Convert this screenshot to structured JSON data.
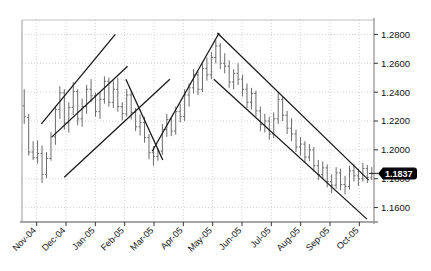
{
  "chart_data": {
    "type": "ohlc",
    "title": "",
    "subtitle": "",
    "xlabel": "",
    "ylabel": "",
    "grid": true,
    "legend": null,
    "y_axis_position": "right",
    "ylim": [
      1.15,
      1.29
    ],
    "yticks": [
      "1.2800",
      "1.2600",
      "1.2400",
      "1.2200",
      "1.2000",
      "1.1800",
      "1.1600"
    ],
    "ytick_values": [
      1.28,
      1.26,
      1.24,
      1.22,
      1.2,
      1.18,
      1.16
    ],
    "xticks": [
      "Nov-04",
      "Dec-04",
      "Jan-05",
      "Feb-05",
      "Mar-05",
      "Apr-05",
      "May-05",
      "Jun-05",
      "Jul-05",
      "Aug-05",
      "Sep-05",
      "Oct-05"
    ],
    "current_price_label": "1.1837",
    "current_price_value": 1.1837,
    "bar_color": "#6b6b6b",
    "trendline_color": "#1a1a1a",
    "grid_color": "#c8c8c8",
    "axis_color": "#8a8a8a",
    "marker_bg": "#000000",
    "marker_fg": "#ffffff",
    "series": [
      {
        "name": "Price",
        "bars": [
          {
            "o": 1.2305,
            "h": 1.242,
            "l": 1.218,
            "c": 1.223
          },
          {
            "o": 1.2225,
            "h": 1.225,
            "l": 1.196,
            "c": 1.1985
          },
          {
            "o": 1.1985,
            "h": 1.206,
            "l": 1.193,
            "c": 1.1945
          },
          {
            "o": 1.1945,
            "h": 1.2065,
            "l": 1.1905,
            "c": 1.1975
          },
          {
            "o": 1.1975,
            "h": 1.203,
            "l": 1.177,
            "c": 1.183
          },
          {
            "o": 1.183,
            "h": 1.1985,
            "l": 1.1805,
            "c": 1.194
          },
          {
            "o": 1.194,
            "h": 1.2125,
            "l": 1.1925,
            "c": 1.209
          },
          {
            "o": 1.209,
            "h": 1.2305,
            "l": 1.2035,
            "c": 1.228
          },
          {
            "o": 1.228,
            "h": 1.244,
            "l": 1.2215,
            "c": 1.2395
          },
          {
            "o": 1.2395,
            "h": 1.242,
            "l": 1.214,
            "c": 1.2185
          },
          {
            "o": 1.2185,
            "h": 1.233,
            "l": 1.212,
            "c": 1.2295
          },
          {
            "o": 1.2295,
            "h": 1.247,
            "l": 1.224,
            "c": 1.2405
          },
          {
            "o": 1.2405,
            "h": 1.242,
            "l": 1.217,
            "c": 1.2215
          },
          {
            "o": 1.2215,
            "h": 1.2355,
            "l": 1.216,
            "c": 1.23
          },
          {
            "o": 1.23,
            "h": 1.245,
            "l": 1.225,
            "c": 1.242
          },
          {
            "o": 1.242,
            "h": 1.249,
            "l": 1.233,
            "c": 1.2375
          },
          {
            "o": 1.2375,
            "h": 1.2395,
            "l": 1.223,
            "c": 1.2265
          },
          {
            "o": 1.2265,
            "h": 1.24,
            "l": 1.2215,
            "c": 1.235
          },
          {
            "o": 1.235,
            "h": 1.251,
            "l": 1.232,
            "c": 1.2475
          },
          {
            "o": 1.2475,
            "h": 1.25,
            "l": 1.23,
            "c": 1.233
          },
          {
            "o": 1.233,
            "h": 1.248,
            "l": 1.229,
            "c": 1.242
          },
          {
            "o": 1.242,
            "h": 1.25,
            "l": 1.2265,
            "c": 1.23
          },
          {
            "o": 1.23,
            "h": 1.233,
            "l": 1.2205,
            "c": 1.225
          },
          {
            "o": 1.225,
            "h": 1.242,
            "l": 1.223,
            "c": 1.238
          },
          {
            "o": 1.238,
            "h": 1.24,
            "l": 1.221,
            "c": 1.226
          },
          {
            "o": 1.226,
            "h": 1.229,
            "l": 1.213,
            "c": 1.216
          },
          {
            "o": 1.216,
            "h": 1.2245,
            "l": 1.21,
            "c": 1.219
          },
          {
            "o": 1.219,
            "h": 1.223,
            "l": 1.205,
            "c": 1.2085
          },
          {
            "o": 1.2085,
            "h": 1.211,
            "l": 1.1935,
            "c": 1.198
          },
          {
            "o": 1.198,
            "h": 1.2025,
            "l": 1.189,
            "c": 1.1955
          },
          {
            "o": 1.1955,
            "h": 1.201,
            "l": 1.1925,
            "c": 1.199
          },
          {
            "o": 1.199,
            "h": 1.218,
            "l": 1.1965,
            "c": 1.214
          },
          {
            "o": 1.214,
            "h": 1.225,
            "l": 1.209,
            "c": 1.221
          },
          {
            "o": 1.221,
            "h": 1.223,
            "l": 1.2095,
            "c": 1.213
          },
          {
            "o": 1.213,
            "h": 1.23,
            "l": 1.2105,
            "c": 1.2265
          },
          {
            "o": 1.2265,
            "h": 1.232,
            "l": 1.219,
            "c": 1.223
          },
          {
            "o": 1.223,
            "h": 1.242,
            "l": 1.22,
            "c": 1.238
          },
          {
            "o": 1.238,
            "h": 1.246,
            "l": 1.23,
            "c": 1.243
          },
          {
            "o": 1.243,
            "h": 1.256,
            "l": 1.239,
            "c": 1.252
          },
          {
            "o": 1.252,
            "h": 1.2545,
            "l": 1.238,
            "c": 1.242
          },
          {
            "o": 1.242,
            "h": 1.26,
            "l": 1.24,
            "c": 1.2565
          },
          {
            "o": 1.2565,
            "h": 1.264,
            "l": 1.248,
            "c": 1.252
          },
          {
            "o": 1.252,
            "h": 1.268,
            "l": 1.249,
            "c": 1.264
          },
          {
            "o": 1.264,
            "h": 1.276,
            "l": 1.26,
            "c": 1.272
          },
          {
            "o": 1.272,
            "h": 1.274,
            "l": 1.256,
            "c": 1.26
          },
          {
            "o": 1.26,
            "h": 1.267,
            "l": 1.253,
            "c": 1.258
          },
          {
            "o": 1.258,
            "h": 1.262,
            "l": 1.243,
            "c": 1.247
          },
          {
            "o": 1.247,
            "h": 1.256,
            "l": 1.242,
            "c": 1.253
          },
          {
            "o": 1.253,
            "h": 1.26,
            "l": 1.245,
            "c": 1.249
          },
          {
            "o": 1.249,
            "h": 1.252,
            "l": 1.237,
            "c": 1.242
          },
          {
            "o": 1.242,
            "h": 1.246,
            "l": 1.229,
            "c": 1.233
          },
          {
            "o": 1.233,
            "h": 1.243,
            "l": 1.228,
            "c": 1.239
          },
          {
            "o": 1.239,
            "h": 1.241,
            "l": 1.223,
            "c": 1.227
          },
          {
            "o": 1.227,
            "h": 1.23,
            "l": 1.213,
            "c": 1.2175
          },
          {
            "o": 1.2175,
            "h": 1.225,
            "l": 1.212,
            "c": 1.22
          },
          {
            "o": 1.22,
            "h": 1.223,
            "l": 1.207,
            "c": 1.211
          },
          {
            "o": 1.211,
            "h": 1.226,
            "l": 1.208,
            "c": 1.2215
          },
          {
            "o": 1.2215,
            "h": 1.2395,
            "l": 1.218,
            "c": 1.235
          },
          {
            "o": 1.235,
            "h": 1.237,
            "l": 1.22,
            "c": 1.224
          },
          {
            "o": 1.224,
            "h": 1.227,
            "l": 1.211,
            "c": 1.215
          },
          {
            "o": 1.215,
            "h": 1.222,
            "l": 1.206,
            "c": 1.211
          },
          {
            "o": 1.211,
            "h": 1.214,
            "l": 1.1985,
            "c": 1.202
          },
          {
            "o": 1.202,
            "h": 1.209,
            "l": 1.196,
            "c": 1.204
          },
          {
            "o": 1.204,
            "h": 1.206,
            "l": 1.191,
            "c": 1.195
          },
          {
            "o": 1.195,
            "h": 1.204,
            "l": 1.192,
            "c": 1.2
          },
          {
            "o": 1.2,
            "h": 1.202,
            "l": 1.185,
            "c": 1.189
          },
          {
            "o": 1.189,
            "h": 1.193,
            "l": 1.179,
            "c": 1.183
          },
          {
            "o": 1.183,
            "h": 1.192,
            "l": 1.18,
            "c": 1.1875
          },
          {
            "o": 1.1875,
            "h": 1.19,
            "l": 1.174,
            "c": 1.178
          },
          {
            "o": 1.178,
            "h": 1.183,
            "l": 1.17,
            "c": 1.1755
          },
          {
            "o": 1.1755,
            "h": 1.188,
            "l": 1.173,
            "c": 1.184
          },
          {
            "o": 1.184,
            "h": 1.187,
            "l": 1.172,
            "c": 1.176
          },
          {
            "o": 1.176,
            "h": 1.182,
            "l": 1.169,
            "c": 1.1745
          },
          {
            "o": 1.1745,
            "h": 1.189,
            "l": 1.1725,
            "c": 1.1855
          },
          {
            "o": 1.1855,
            "h": 1.19,
            "l": 1.178,
            "c": 1.182
          },
          {
            "o": 1.182,
            "h": 1.187,
            "l": 1.175,
            "c": 1.18
          },
          {
            "o": 1.18,
            "h": 1.191,
            "l": 1.178,
            "c": 1.187
          },
          {
            "o": 1.187,
            "h": 1.1895,
            "l": 1.177,
            "c": 1.181
          },
          {
            "o": 1.181,
            "h": 1.188,
            "l": 1.179,
            "c": 1.1837
          }
        ]
      }
    ],
    "trendlines": [
      {
        "name": "rising-channel-upper",
        "x1": 0.055,
        "y1": 1.218,
        "x2": 0.265,
        "y2": 1.28
      },
      {
        "name": "rising-channel-mid",
        "x1": 0.085,
        "y1": 1.209,
        "x2": 0.3,
        "y2": 1.258
      },
      {
        "name": "rising-channel-lower",
        "x1": 0.12,
        "y1": 1.181,
        "x2": 0.42,
        "y2": 1.249
      },
      {
        "name": "falling-short-upper",
        "x1": 0.295,
        "y1": 1.249,
        "x2": 0.4,
        "y2": 1.193
      },
      {
        "name": "rising-major",
        "x1": 0.37,
        "y1": 1.199,
        "x2": 0.56,
        "y2": 1.281
      },
      {
        "name": "falling-channel-upper",
        "x1": 0.555,
        "y1": 1.281,
        "x2": 0.985,
        "y2": 1.179
      },
      {
        "name": "falling-channel-lower",
        "x1": 0.545,
        "y1": 1.249,
        "x2": 0.98,
        "y2": 1.152
      }
    ]
  }
}
